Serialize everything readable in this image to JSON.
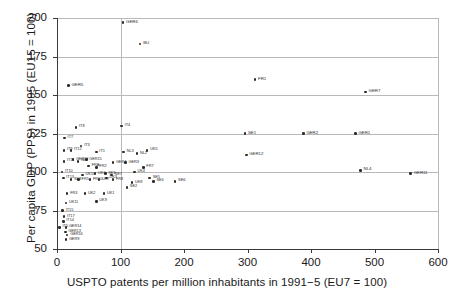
{
  "chart_data": {
    "type": "scatter",
    "title": "",
    "xlabel": "USPTO patents per million inhabitants in 1991−5 (EU7 = 100)",
    "ylabel": "Per capita GDP (PPS) in 1995 (EU15 = 100)",
    "xlim": [
      0,
      600
    ],
    "ylim": [
      50,
      200
    ],
    "xticks": [
      0,
      100,
      200,
      300,
      400,
      500,
      600
    ],
    "yticks": [
      50,
      75,
      100,
      125,
      150,
      175,
      200
    ],
    "grid": "horizontal-and-vertical-at-100",
    "legend": "none",
    "marker_color": "#2b2b2b",
    "points": [
      {
        "label": "GER6",
        "x": 104,
        "y": 197
      },
      {
        "label": "BU",
        "x": 131,
        "y": 183
      },
      {
        "label": "FR1",
        "x": 312,
        "y": 160
      },
      {
        "label": "GER5",
        "x": 18,
        "y": 156
      },
      {
        "label": "GER7",
        "x": 486,
        "y": 152
      },
      {
        "label": "IT8",
        "x": 30,
        "y": 129
      },
      {
        "label": "IT4",
        "x": 102,
        "y": 130
      },
      {
        "label": "SE1",
        "x": 296,
        "y": 125
      },
      {
        "label": "GER2",
        "x": 388,
        "y": 125
      },
      {
        "label": "GER1",
        "x": 470,
        "y": 125
      },
      {
        "label": "IT7",
        "x": 12,
        "y": 122
      },
      {
        "label": "IT3",
        "x": 38,
        "y": 117
      },
      {
        "label": "IT9",
        "x": 11,
        "y": 114
      },
      {
        "label": "IT12",
        "x": 22,
        "y": 114
      },
      {
        "label": "IT1",
        "x": 62,
        "y": 113
      },
      {
        "label": "NL3",
        "x": 105,
        "y": 113
      },
      {
        "label": "NL2",
        "x": 126,
        "y": 112
      },
      {
        "label": "UK5",
        "x": 142,
        "y": 114
      },
      {
        "label": "GER12",
        "x": 298,
        "y": 111
      },
      {
        "label": "IT11",
        "x": 11,
        "y": 107
      },
      {
        "label": "NL1",
        "x": 33,
        "y": 107
      },
      {
        "label": "GER12b",
        "x": 25,
        "y": 108
      },
      {
        "label": "GER15",
        "x": 46,
        "y": 108
      },
      {
        "label": "GER4",
        "x": 88,
        "y": 106
      },
      {
        "label": "GER3",
        "x": 108,
        "y": 106
      },
      {
        "label": "FRA",
        "x": 50,
        "y": 104
      },
      {
        "label": "FR2",
        "x": 62,
        "y": 103
      },
      {
        "label": "FR7",
        "x": 136,
        "y": 103
      },
      {
        "label": "IT10",
        "x": 8,
        "y": 100
      },
      {
        "label": "UK4",
        "x": 122,
        "y": 100
      },
      {
        "label": "NL4",
        "x": 478,
        "y": 101
      },
      {
        "label": "GER11",
        "x": 557,
        "y": 99
      },
      {
        "label": "UK10",
        "x": 40,
        "y": 98
      },
      {
        "label": "UK6",
        "x": 60,
        "y": 99
      },
      {
        "label": "SE3",
        "x": 76,
        "y": 99
      },
      {
        "label": "SE7",
        "x": 86,
        "y": 98
      },
      {
        "label": "IT13",
        "x": 10,
        "y": 96
      },
      {
        "label": "SE8",
        "x": 22,
        "y": 95
      },
      {
        "label": "FR5",
        "x": 34,
        "y": 95
      },
      {
        "label": "FR10",
        "x": 52,
        "y": 95
      },
      {
        "label": "UK7",
        "x": 66,
        "y": 95
      },
      {
        "label": "UK3",
        "x": 78,
        "y": 96
      },
      {
        "label": "FR8",
        "x": 88,
        "y": 95
      },
      {
        "label": "UK8",
        "x": 118,
        "y": 93
      },
      {
        "label": "SE5",
        "x": 146,
        "y": 96
      },
      {
        "label": "SE4",
        "x": 152,
        "y": 94
      },
      {
        "label": "SE6",
        "x": 186,
        "y": 94
      },
      {
        "label": "SE2",
        "x": 110,
        "y": 90
      },
      {
        "label": "FR3",
        "x": 16,
        "y": 86
      },
      {
        "label": "UK2",
        "x": 44,
        "y": 86
      },
      {
        "label": "UK1",
        "x": 74,
        "y": 86
      },
      {
        "label": "UK9",
        "x": 62,
        "y": 81
      },
      {
        "label": "UK11",
        "x": 14,
        "y": 80
      },
      {
        "label": "IT15",
        "x": 9,
        "y": 75
      },
      {
        "label": "IT17",
        "x": 11,
        "y": 71
      },
      {
        "label": "IT14",
        "x": 10,
        "y": 68
      },
      {
        "label": "IT5",
        "x": 4,
        "y": 64
      },
      {
        "label": "GER14",
        "x": 14,
        "y": 64
      },
      {
        "label": "GER13",
        "x": 13,
        "y": 61
      },
      {
        "label": "GER16",
        "x": 16,
        "y": 59
      },
      {
        "label": "GER9",
        "x": 14,
        "y": 56
      }
    ]
  }
}
